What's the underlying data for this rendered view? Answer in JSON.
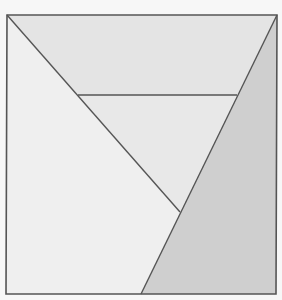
{
  "diagram": {
    "title": "",
    "type": "square dissection",
    "background": "#f7f7f7",
    "stroke_color": "#555555",
    "outer_square": {
      "points": [
        [
          7,
          15
        ],
        [
          277,
          15
        ],
        [
          276,
          294
        ],
        [
          6,
          294
        ]
      ]
    },
    "regions": [
      {
        "name": "top-trapezoid",
        "points": [
          [
            7,
            15
          ],
          [
            277,
            15
          ],
          [
            237,
            95
          ],
          [
            78,
            95
          ]
        ],
        "fill": "#e4e4e4"
      },
      {
        "name": "middle-triangle",
        "points": [
          [
            78,
            95
          ],
          [
            237,
            95
          ],
          [
            180,
            212
          ]
        ],
        "fill": "#e8e8e8"
      },
      {
        "name": "left-region",
        "points": [
          [
            7,
            15
          ],
          [
            180,
            212
          ],
          [
            141,
            294
          ],
          [
            6,
            294
          ]
        ],
        "fill": "#efefef"
      },
      {
        "name": "right-region",
        "points": [
          [
            277,
            15
          ],
          [
            276,
            294
          ],
          [
            141,
            294
          ]
        ],
        "fill": "#cfcfcf"
      }
    ],
    "lines": [
      {
        "name": "diagonal-line",
        "from": [
          7,
          15
        ],
        "to": [
          180,
          212
        ]
      },
      {
        "name": "horizontal-line",
        "from": [
          78,
          95
        ],
        "to": [
          237,
          95
        ]
      },
      {
        "name": "slanted-line",
        "from": [
          277,
          15
        ],
        "to": [
          141,
          294
        ]
      }
    ]
  }
}
